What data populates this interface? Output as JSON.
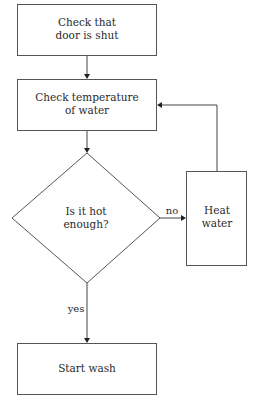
{
  "diagram": {
    "type": "flowchart",
    "nodes": {
      "check_door": {
        "kind": "process",
        "line1": "Check that",
        "line2": "door is shut"
      },
      "check_temp": {
        "kind": "process",
        "line1": "Check temperature",
        "line2": "of water"
      },
      "decision": {
        "kind": "decision",
        "line1": "Is it hot",
        "line2": "enough?"
      },
      "heat_water": {
        "kind": "process",
        "line1": "Heat",
        "line2": "water"
      },
      "start_wash": {
        "kind": "process",
        "line1": "Start wash"
      }
    },
    "edges": {
      "door_to_temp": {
        "from": "check_door",
        "to": "check_temp",
        "label": ""
      },
      "temp_to_decision": {
        "from": "check_temp",
        "to": "decision",
        "label": ""
      },
      "decision_no": {
        "from": "decision",
        "to": "heat_water",
        "label": "no"
      },
      "heat_to_temp": {
        "from": "heat_water",
        "to": "check_temp",
        "label": ""
      },
      "decision_yes": {
        "from": "decision",
        "to": "start_wash",
        "label": "yes"
      }
    },
    "colors": {
      "stroke": "#555555",
      "arrow": "#222222",
      "text": "#2a2a2a",
      "background": "#ffffff"
    }
  }
}
